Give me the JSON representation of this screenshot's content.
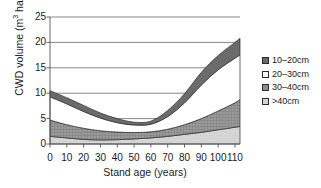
{
  "chart_data": {
    "type": "area",
    "title": "",
    "xlabel": "Stand age (years)",
    "ylabel": "CWD volume (m3 ha-1)",
    "ylabel_parts": {
      "prefix": "CWD volume (m",
      "sup1": "3",
      "mid": " ha",
      "sup2": "−1",
      "suffix": ")"
    },
    "xlim": [
      0,
      113
    ],
    "ylim": [
      0,
      25
    ],
    "xticks": [
      0,
      10,
      20,
      30,
      40,
      50,
      60,
      70,
      80,
      90,
      100,
      110
    ],
    "yticks": [
      0,
      5,
      10,
      15,
      20,
      25
    ],
    "grid": "horizontal",
    "legend_position": "right",
    "x": [
      0,
      10,
      20,
      30,
      40,
      50,
      60,
      70,
      80,
      90,
      100,
      110,
      113
    ],
    "series": [
      {
        "name": ">40cm",
        "color": "#d2d2d2",
        "lower": [
          0,
          0,
          0,
          0,
          0,
          0,
          0,
          0,
          0,
          0,
          0,
          0,
          0
        ],
        "upper": [
          1.5,
          1.2,
          0.9,
          0.8,
          0.85,
          1.0,
          1.2,
          1.5,
          1.9,
          2.3,
          2.8,
          3.3,
          3.45
        ]
      },
      {
        "name": "30-40cm",
        "color": "#8e8e8e",
        "lower": [
          1.5,
          1.2,
          0.9,
          0.8,
          0.85,
          1.0,
          1.2,
          1.5,
          1.9,
          2.3,
          2.8,
          3.3,
          3.45
        ],
        "upper": [
          4.7,
          3.8,
          3.1,
          2.6,
          2.35,
          2.25,
          2.4,
          2.9,
          3.8,
          5.0,
          6.5,
          8.1,
          8.8
        ]
      },
      {
        "name": "20-30cm",
        "color": "#ffffff",
        "lower": [
          4.7,
          3.8,
          3.1,
          2.6,
          2.35,
          2.25,
          2.4,
          2.9,
          3.8,
          5.0,
          6.5,
          8.1,
          8.8
        ],
        "upper": [
          9.3,
          7.9,
          6.4,
          5.1,
          4.2,
          3.75,
          3.9,
          5.4,
          8.1,
          11.6,
          14.6,
          16.9,
          17.5
        ]
      },
      {
        "name": "10-20cm",
        "color": "#6b6b6b",
        "lower": [
          9.3,
          7.9,
          6.4,
          5.1,
          4.2,
          3.75,
          3.9,
          5.4,
          8.1,
          11.6,
          14.6,
          16.9,
          17.5
        ],
        "upper": [
          10.5,
          9.1,
          7.6,
          6.1,
          5.0,
          4.3,
          4.5,
          6.6,
          9.9,
          14.1,
          17.4,
          20.0,
          20.8
        ]
      }
    ]
  },
  "legend": {
    "items": [
      {
        "label": "10–20cm",
        "swatch": "#6b6b6b"
      },
      {
        "label": "20–30cm",
        "swatch": "#ffffff"
      },
      {
        "label": "30–40cm",
        "swatch": "#8e8e8e"
      },
      {
        "label": ">40cm",
        "swatch": "#d2d2d2"
      }
    ]
  },
  "axes": {
    "y_tick_labels": [
      "25",
      "20",
      "15",
      "10",
      "5",
      "0"
    ],
    "x_tick_labels": [
      "0",
      "10",
      "20",
      "30",
      "40",
      "50",
      "60",
      "70",
      "80",
      "90",
      "100",
      "110"
    ]
  }
}
